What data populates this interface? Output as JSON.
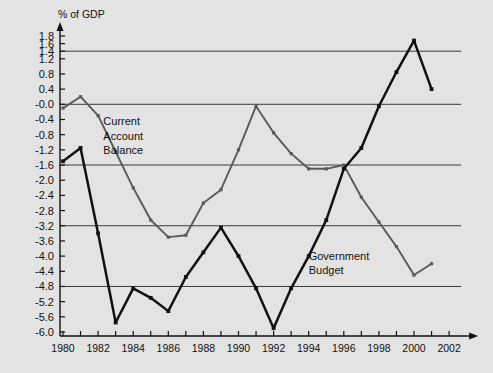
{
  "chart_data": {
    "type": "line",
    "title": "",
    "ylabel": "% of GDP",
    "xlabel": "",
    "ylim": [
      -6.0,
      1.8
    ],
    "xlim": [
      1980,
      2002
    ],
    "grid": true,
    "gridlines_y": [
      1.4,
      -0.0,
      -1.6,
      -3.2,
      -4.8
    ],
    "legend_position": "inline-annotation",
    "y_tick_labels": [
      "1.8",
      "1.6",
      "1.4",
      "1.2",
      "0.8",
      "0.4",
      "-0.0",
      "-0.4",
      "-0.8",
      "-1.2",
      "-1.6",
      "-2.0",
      "-2.4",
      "-2.8",
      "-3.2",
      "-3.6",
      "-4.0",
      "-4.4",
      "-4.8",
      "-5.2",
      "-5.6",
      "-6.0"
    ],
    "y_tick_values": [
      1.8,
      1.6,
      1.4,
      1.2,
      0.8,
      0.4,
      0.0,
      -0.4,
      -0.8,
      -1.2,
      -1.6,
      -2.0,
      -2.4,
      -2.8,
      -3.2,
      -3.6,
      -4.0,
      -4.4,
      -4.8,
      -5.2,
      -5.6,
      -6.0
    ],
    "x_tick_labels": [
      "1980",
      "1982",
      "1984",
      "1986",
      "1988",
      "1990",
      "1992",
      "1994",
      "1996",
      "1998",
      "2000",
      "2002"
    ],
    "x_tick_values": [
      1980,
      1982,
      1984,
      1986,
      1988,
      1990,
      1992,
      1994,
      1996,
      1998,
      2000,
      2002
    ],
    "x_minor_ticks": [
      1981,
      1983,
      1985,
      1987,
      1989,
      1991,
      1993,
      1995,
      1997,
      1999,
      2001
    ],
    "x": [
      1980,
      1981,
      1982,
      1983,
      1984,
      1985,
      1986,
      1987,
      1988,
      1989,
      1990,
      1991,
      1992,
      1993,
      1994,
      1995,
      1996,
      1997,
      1998,
      1999,
      2000,
      2001
    ],
    "series": [
      {
        "name": "Current Account Balance",
        "color": "#5a5a5a",
        "marker": "square",
        "values": [
          -0.1,
          0.2,
          -0.3,
          -1.25,
          -2.2,
          -3.05,
          -3.5,
          -3.45,
          -2.6,
          -2.25,
          -1.2,
          -0.05,
          -0.75,
          -1.3,
          -1.7,
          -1.7,
          -1.6,
          -2.45,
          -3.1,
          -3.75,
          -4.5,
          -4.2
        ],
        "label_lines": [
          "Current",
          "Account",
          "Balance"
        ],
        "label_x": 1982.3,
        "label_y": -0.55
      },
      {
        "name": "Government Budget",
        "color": "#111111",
        "marker": "square",
        "values": [
          -1.5,
          -1.15,
          -3.4,
          -5.75,
          -4.85,
          -5.1,
          -5.45,
          -4.55,
          -3.9,
          -3.25,
          -4.0,
          -4.85,
          -5.9,
          -4.85,
          -4.0,
          -3.05,
          -1.7,
          -1.15,
          -0.05,
          0.85,
          1.68,
          0.4
        ],
        "label_lines": [
          "Government",
          "Budget"
        ],
        "label_x": 1994.0,
        "label_y": -4.1
      }
    ]
  },
  "colors": {
    "background": "#e3e3e3",
    "gridline": "#3a3a3a",
    "axis": "#111111",
    "current_account": "#5a5a5a",
    "government_budget": "#111111"
  }
}
